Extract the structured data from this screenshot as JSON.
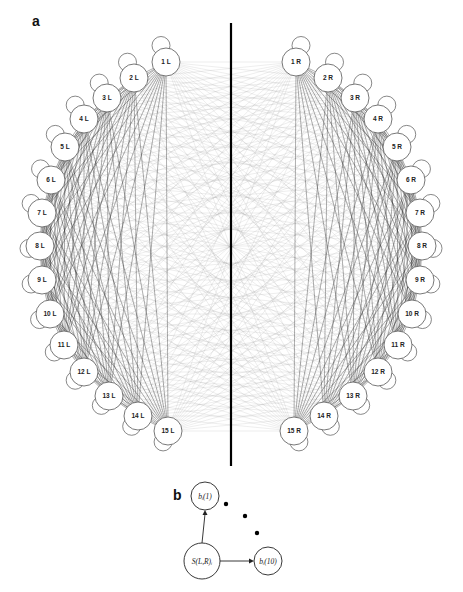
{
  "panel_a": {
    "label": "a",
    "divider": {
      "x": 231,
      "y1": 23,
      "y2": 466,
      "color": "#000000"
    },
    "node_radius": 14,
    "satellite_radius": 9,
    "left_nodes": [
      {
        "label": "1 L",
        "x": 166,
        "y": 62
      },
      {
        "label": "2 L",
        "x": 134,
        "y": 78
      },
      {
        "label": "3 L",
        "x": 107,
        "y": 98
      },
      {
        "label": "4 L",
        "x": 84,
        "y": 119
      },
      {
        "label": "5 L",
        "x": 65,
        "y": 147
      },
      {
        "label": "6 L",
        "x": 51,
        "y": 180
      },
      {
        "label": "7 L",
        "x": 42,
        "y": 213
      },
      {
        "label": "8 L",
        "x": 40,
        "y": 246
      },
      {
        "label": "9 L",
        "x": 42,
        "y": 280
      },
      {
        "label": "10 L",
        "x": 50,
        "y": 314
      },
      {
        "label": "11 L",
        "x": 64,
        "y": 345
      },
      {
        "label": "12 L",
        "x": 84,
        "y": 372
      },
      {
        "label": "13 L",
        "x": 109,
        "y": 396
      },
      {
        "label": "14 L",
        "x": 138,
        "y": 416
      },
      {
        "label": "15 L",
        "x": 168,
        "y": 431
      }
    ],
    "right_nodes": [
      {
        "label": "1 R",
        "x": 296,
        "y": 62
      },
      {
        "label": "2 R",
        "x": 328,
        "y": 78
      },
      {
        "label": "3 R",
        "x": 355,
        "y": 98
      },
      {
        "label": "4 R",
        "x": 378,
        "y": 119
      },
      {
        "label": "5 R",
        "x": 397,
        "y": 147
      },
      {
        "label": "6 R",
        "x": 411,
        "y": 180
      },
      {
        "label": "7 R",
        "x": 420,
        "y": 213
      },
      {
        "label": "8 R",
        "x": 422,
        "y": 246
      },
      {
        "label": "9 R",
        "x": 420,
        "y": 280
      },
      {
        "label": "10 R",
        "x": 412,
        "y": 314
      },
      {
        "label": "11 R",
        "x": 398,
        "y": 345
      },
      {
        "label": "12 R",
        "x": 378,
        "y": 372
      },
      {
        "label": "13 R",
        "x": 353,
        "y": 396
      },
      {
        "label": "14 R",
        "x": 324,
        "y": 416
      },
      {
        "label": "15 R",
        "x": 294,
        "y": 431
      }
    ],
    "colors": {
      "same_side_edges": "#2a2a2a",
      "cross_edges": "#9a9a9a",
      "node_stroke": "#555555",
      "node_fill": "#ffffff"
    }
  },
  "panel_b": {
    "label": "b",
    "nodes": [
      {
        "id": "b1",
        "label": "bᵢ(1)",
        "x": 205,
        "y": 496,
        "r": 14
      },
      {
        "id": "s",
        "label": "S(L,R)ᵢ",
        "x": 202,
        "y": 561,
        "r": 18
      },
      {
        "id": "b10",
        "label": "bᵢ(10)",
        "x": 268,
        "y": 561,
        "r": 14
      }
    ],
    "ellipsis_dots": [
      {
        "x": 226,
        "y": 504
      },
      {
        "x": 245,
        "y": 516
      },
      {
        "x": 257,
        "y": 533
      }
    ]
  }
}
